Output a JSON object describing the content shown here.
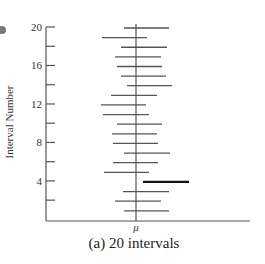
{
  "chart_data": {
    "type": "interval",
    "title": "(a) 20 intervals",
    "xlabel": "",
    "ylabel": "Interval Number",
    "x_marker": "μ",
    "ylim": [
      0,
      20
    ],
    "yticks_labeled": [
      4,
      8,
      12,
      16,
      20
    ],
    "yticks_all": [
      2,
      4,
      6,
      8,
      10,
      12,
      14,
      16,
      18,
      20
    ],
    "grid": false,
    "mu_x": 136,
    "intervals": [
      {
        "n": 1,
        "lo": 124,
        "hi": 169,
        "covers_mu": true
      },
      {
        "n": 2,
        "lo": 115,
        "hi": 161,
        "covers_mu": true
      },
      {
        "n": 3,
        "lo": 123,
        "hi": 169,
        "covers_mu": true
      },
      {
        "n": 4,
        "lo": 143,
        "hi": 189,
        "covers_mu": false
      },
      {
        "n": 5,
        "lo": 104,
        "hi": 149,
        "covers_mu": true
      },
      {
        "n": 6,
        "lo": 113,
        "hi": 158,
        "covers_mu": true
      },
      {
        "n": 7,
        "lo": 124,
        "hi": 170,
        "covers_mu": true
      },
      {
        "n": 8,
        "lo": 113,
        "hi": 158,
        "covers_mu": true
      },
      {
        "n": 9,
        "lo": 112,
        "hi": 157,
        "covers_mu": true
      },
      {
        "n": 10,
        "lo": 117,
        "hi": 162,
        "covers_mu": true
      },
      {
        "n": 11,
        "lo": 103,
        "hi": 149,
        "covers_mu": true
      },
      {
        "n": 12,
        "lo": 101,
        "hi": 146,
        "covers_mu": true
      },
      {
        "n": 13,
        "lo": 111,
        "hi": 157,
        "covers_mu": true
      },
      {
        "n": 14,
        "lo": 127,
        "hi": 172,
        "covers_mu": true
      },
      {
        "n": 15,
        "lo": 121,
        "hi": 166,
        "covers_mu": true
      },
      {
        "n": 16,
        "lo": 117,
        "hi": 162,
        "covers_mu": true
      },
      {
        "n": 17,
        "lo": 115,
        "hi": 161,
        "covers_mu": true
      },
      {
        "n": 18,
        "lo": 121,
        "hi": 167,
        "covers_mu": true
      },
      {
        "n": 19,
        "lo": 102,
        "hi": 147,
        "covers_mu": true
      },
      {
        "n": 20,
        "lo": 124,
        "hi": 169,
        "covers_mu": true
      }
    ]
  },
  "labels": {
    "ylabel": "Interval Number",
    "mu": "μ",
    "caption": "(a) 20 intervals",
    "ticks": [
      "20",
      "16",
      "12",
      "8",
      "4"
    ]
  },
  "colors": {
    "line": "#555555",
    "miss": "#111111",
    "axis": "#555555",
    "dot": "#777777"
  }
}
